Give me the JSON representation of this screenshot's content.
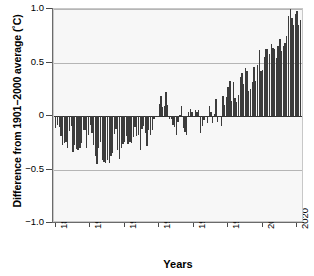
{
  "chart_data": {
    "type": "bar",
    "title": "",
    "xlabel": "Years",
    "ylabel": "Difference from 1901−2000 average (˚C)",
    "xlim": [
      1879,
      2024
    ],
    "ylim": [
      -1.0,
      1.0
    ],
    "grid": true,
    "legend_position": "none",
    "bar_color": "#3c3c3c",
    "plot_background": "#f7f7f7",
    "yticks": [
      "1.0",
      "0.5",
      "0",
      "−0.5",
      "−1.0"
    ],
    "ytick_values": [
      1.0,
      0.5,
      0,
      -0.5,
      -1.0
    ],
    "xticks": [
      "1880",
      "1900",
      "1920",
      "1940",
      "1960",
      "1980",
      "2000",
      "2020"
    ],
    "xtick_values": [
      1880,
      1900,
      1920,
      1940,
      1960,
      1980,
      2000,
      2020
    ],
    "x": [
      1880,
      1881,
      1882,
      1883,
      1884,
      1885,
      1886,
      1887,
      1888,
      1889,
      1890,
      1891,
      1892,
      1893,
      1894,
      1895,
      1896,
      1897,
      1898,
      1899,
      1900,
      1901,
      1902,
      1903,
      1904,
      1905,
      1906,
      1907,
      1908,
      1909,
      1910,
      1911,
      1912,
      1913,
      1914,
      1915,
      1916,
      1917,
      1918,
      1919,
      1920,
      1921,
      1922,
      1923,
      1924,
      1925,
      1926,
      1927,
      1928,
      1929,
      1930,
      1931,
      1932,
      1933,
      1934,
      1935,
      1936,
      1937,
      1938,
      1939,
      1940,
      1941,
      1942,
      1943,
      1944,
      1945,
      1946,
      1947,
      1948,
      1949,
      1950,
      1951,
      1952,
      1953,
      1954,
      1955,
      1956,
      1957,
      1958,
      1959,
      1960,
      1961,
      1962,
      1963,
      1964,
      1965,
      1966,
      1967,
      1968,
      1969,
      1970,
      1971,
      1972,
      1973,
      1974,
      1975,
      1976,
      1977,
      1978,
      1979,
      1980,
      1981,
      1982,
      1983,
      1984,
      1985,
      1986,
      1987,
      1988,
      1989,
      1990,
      1991,
      1992,
      1993,
      1994,
      1995,
      1996,
      1997,
      1998,
      1999,
      2000,
      2001,
      2002,
      2003,
      2004,
      2005,
      2006,
      2007,
      2008,
      2009,
      2010,
      2011,
      2012,
      2013,
      2014,
      2015,
      2016,
      2017,
      2018,
      2019,
      2020,
      2021,
      2022,
      2023
    ],
    "values": [
      -0.11,
      -0.08,
      -0.1,
      -0.19,
      -0.27,
      -0.25,
      -0.24,
      -0.3,
      -0.14,
      -0.09,
      -0.34,
      -0.27,
      -0.31,
      -0.32,
      -0.3,
      -0.25,
      -0.13,
      -0.13,
      -0.3,
      -0.18,
      -0.08,
      -0.16,
      -0.27,
      -0.37,
      -0.45,
      -0.3,
      -0.24,
      -0.41,
      -0.43,
      -0.44,
      -0.41,
      -0.44,
      -0.37,
      -0.35,
      -0.17,
      -0.12,
      -0.32,
      -0.4,
      -0.3,
      -0.26,
      -0.24,
      -0.19,
      -0.26,
      -0.24,
      -0.25,
      -0.2,
      -0.1,
      -0.19,
      -0.18,
      -0.32,
      -0.12,
      -0.09,
      -0.16,
      -0.28,
      -0.13,
      -0.18,
      -0.13,
      -0.03,
      0.0,
      -0.01,
      0.11,
      0.19,
      0.08,
      0.09,
      0.22,
      0.1,
      -0.03,
      -0.03,
      -0.08,
      -0.1,
      -0.18,
      -0.06,
      0.01,
      0.09,
      -0.11,
      -0.15,
      -0.18,
      0.04,
      0.07,
      0.04,
      -0.01,
      0.06,
      0.04,
      0.06,
      -0.16,
      -0.09,
      -0.04,
      0.0,
      -0.07,
      0.09,
      0.04,
      -0.07,
      0.02,
      0.16,
      -0.06,
      0.0,
      -0.09,
      0.19,
      0.1,
      0.18,
      0.27,
      0.33,
      0.14,
      0.32,
      0.17,
      0.13,
      0.2,
      0.36,
      0.4,
      0.3,
      0.45,
      0.42,
      0.23,
      0.25,
      0.32,
      0.46,
      0.33,
      0.48,
      0.62,
      0.42,
      0.43,
      0.55,
      0.63,
      0.63,
      0.58,
      0.67,
      0.64,
      0.63,
      0.54,
      0.65,
      0.72,
      0.61,
      0.65,
      0.68,
      0.75,
      0.93,
      1.01,
      0.92,
      0.85,
      0.95,
      0.98,
      0.85,
      0.9,
      1.0
    ]
  }
}
